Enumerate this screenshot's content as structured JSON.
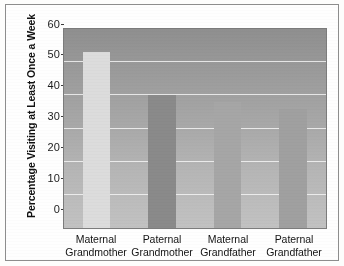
{
  "chart_data": {
    "type": "bar",
    "title": "",
    "xlabel": "",
    "ylabel": "Percentage Visiting at Least Once a Week",
    "categories": [
      "Maternal Grandmother",
      "Paternal Grandmother",
      "Maternal Grandfather",
      "Paternal Grandfather"
    ],
    "category_lines": [
      {
        "line1": "Maternal",
        "line2": "Grandmother"
      },
      {
        "line1": "Paternal",
        "line2": "Grandmother"
      },
      {
        "line1": "Maternal",
        "line2": "Grandfather"
      },
      {
        "line1": "Paternal",
        "line2": "Grandfather"
      }
    ],
    "values": [
      53,
      40,
      38,
      36
    ],
    "ylim": [
      0,
      60
    ],
    "yticks": [
      0,
      10,
      20,
      30,
      40,
      50,
      60
    ],
    "ytick_labels": [
      "0",
      "10",
      "20",
      "30",
      "40",
      "50",
      "60"
    ],
    "grid": true,
    "legend": "none",
    "bar_colors": [
      "#dcdcdc",
      "#8a8a8a",
      "#a6a6a6",
      "#a0a0a0"
    ],
    "plot_background": "gray-vertical-gradient",
    "gridline_color": "#efefef",
    "axis_color": "#3a3a3a"
  }
}
